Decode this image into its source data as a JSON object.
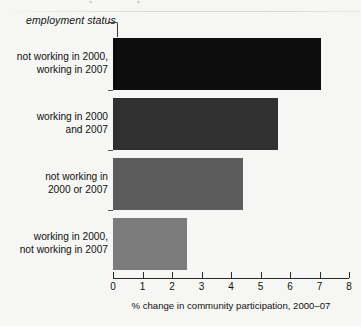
{
  "figure": {
    "axis_group_label": "employment status",
    "background_color": "#f6f6f4"
  },
  "chart_data": {
    "type": "bar",
    "orientation": "horizontal",
    "title": "",
    "subtitle": "",
    "xlabel": "% change in community participation, 2000–07",
    "ylabel": "employment status",
    "categories": [
      "not working in 2000,\nworking in 2007",
      "working in 2000\nand 2007",
      "not working in\n2000 or 2007",
      "working in 2000,\nnot working in 2007"
    ],
    "values": [
      7.05,
      5.6,
      4.4,
      2.5
    ],
    "bar_colors": [
      "#0d0d0d",
      "#303030",
      "#5c5c5c",
      "#7b7b7b"
    ],
    "xlim": [
      0,
      8
    ],
    "xticks": [
      0,
      1,
      2,
      3,
      4,
      5,
      6,
      7,
      8
    ],
    "xtick_labels": [
      "0",
      "1",
      "2",
      "3",
      "4",
      "5",
      "6",
      "7",
      "8"
    ],
    "grid": false,
    "legend": "none"
  }
}
